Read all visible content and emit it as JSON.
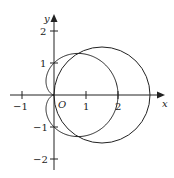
{
  "figure": {
    "type": "polar-curves",
    "curves": [
      {
        "name": "cardioid",
        "equation": "r = 1 + cos(theta)"
      },
      {
        "name": "circle",
        "equation": "r = 3 cos(theta)"
      }
    ]
  },
  "axes": {
    "x_label": "x",
    "y_label": "y",
    "origin_label": "O",
    "x_ticks": [
      "−1",
      "1",
      "2"
    ],
    "y_ticks": [
      "2",
      "1",
      "−1",
      "−2"
    ]
  },
  "colors": {
    "stroke": "#222222",
    "background": "#ffffff"
  }
}
